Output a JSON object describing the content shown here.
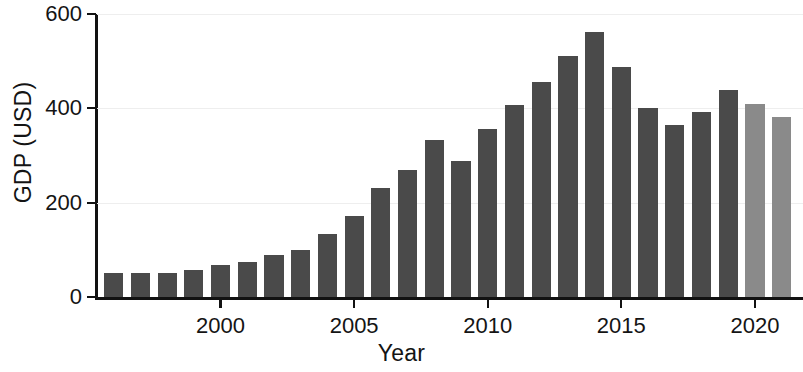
{
  "chart_data": {
    "type": "bar",
    "title": "",
    "xlabel": "Year",
    "ylabel": "GDP (USD)",
    "categories": [
      1996,
      1997,
      1998,
      1999,
      2000,
      2001,
      2002,
      2003,
      2004,
      2005,
      2006,
      2007,
      2008,
      2009,
      2010,
      2011,
      2012,
      2013,
      2014,
      2015,
      2016,
      2017,
      2018,
      2019,
      2020,
      2021
    ],
    "values": [
      51,
      51,
      51,
      57,
      67,
      74,
      89,
      100,
      134,
      172,
      232,
      270,
      333,
      288,
      357,
      408,
      455,
      511,
      561,
      488,
      400,
      364,
      392,
      438,
      410,
      382
    ],
    "bar_colors": [
      "#4a4a4a",
      "#4a4a4a",
      "#4a4a4a",
      "#4a4a4a",
      "#4a4a4a",
      "#4a4a4a",
      "#4a4a4a",
      "#4a4a4a",
      "#4a4a4a",
      "#4a4a4a",
      "#4a4a4a",
      "#4a4a4a",
      "#4a4a4a",
      "#4a4a4a",
      "#4a4a4a",
      "#4a4a4a",
      "#4a4a4a",
      "#4a4a4a",
      "#4a4a4a",
      "#4a4a4a",
      "#4a4a4a",
      "#4a4a4a",
      "#4a4a4a",
      "#4a4a4a",
      "#8a8a8a",
      "#8a8a8a"
    ],
    "ylim": [
      0,
      600
    ],
    "xlim": [
      1995.3,
      2021.8
    ],
    "yticks": [
      0,
      200,
      400,
      600
    ],
    "ytick_labels": [
      "0",
      "200",
      "400",
      "600"
    ],
    "xticks": [
      2000,
      2005,
      2010,
      2015,
      2020
    ],
    "xtick_labels": [
      "2000",
      "2005",
      "2010",
      "2015",
      "2020"
    ],
    "grid": true,
    "grid_axis": "y",
    "grid_color": "#eeeeee",
    "legend": null,
    "colors": {
      "bar_dark": "#4a4a4a",
      "bar_light": "#8a8a8a",
      "axis": "#121212",
      "text": "#141414",
      "background": "#ffffff"
    }
  }
}
